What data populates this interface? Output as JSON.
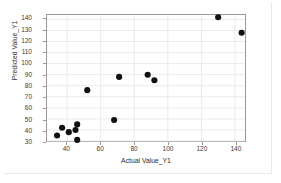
{
  "chart_data": {
    "type": "scatter",
    "title": "",
    "xlabel": "Actual Value_Y1",
    "ylabel": "Predicted Value_Y1",
    "xlim": [
      28,
      146
    ],
    "ylim": [
      30,
      144
    ],
    "xticks": [
      40,
      60,
      80,
      100,
      120,
      140
    ],
    "yticks": [
      30,
      40,
      50,
      60,
      70,
      80,
      90,
      100,
      110,
      120,
      130,
      140
    ],
    "xtick_labels": [
      "40",
      "60",
      "80",
      "100",
      "120",
      "140"
    ],
    "ytick_labels": [
      "30",
      "40",
      "50",
      "60",
      "70",
      "80",
      "90",
      "100",
      "110",
      "120",
      "130",
      "140"
    ],
    "grid": true,
    "grid_color": "#e4e4e4",
    "legend": false,
    "marker_color": "#111111",
    "marker_size": 3.1,
    "axis_color": "#9a9a9a",
    "series": [
      {
        "name": "Predicted Value_Y1",
        "points": [
          {
            "x": 34,
            "y": 35
          },
          {
            "x": 37,
            "y": 42
          },
          {
            "x": 41,
            "y": 38
          },
          {
            "x": 45,
            "y": 40
          },
          {
            "x": 46,
            "y": 45
          },
          {
            "x": 46,
            "y": 31
          },
          {
            "x": 52,
            "y": 76
          },
          {
            "x": 68,
            "y": 49
          },
          {
            "x": 71,
            "y": 88
          },
          {
            "x": 88,
            "y": 90
          },
          {
            "x": 92,
            "y": 85
          },
          {
            "x": 130,
            "y": 142
          },
          {
            "x": 144,
            "y": 128
          }
        ]
      }
    ]
  }
}
